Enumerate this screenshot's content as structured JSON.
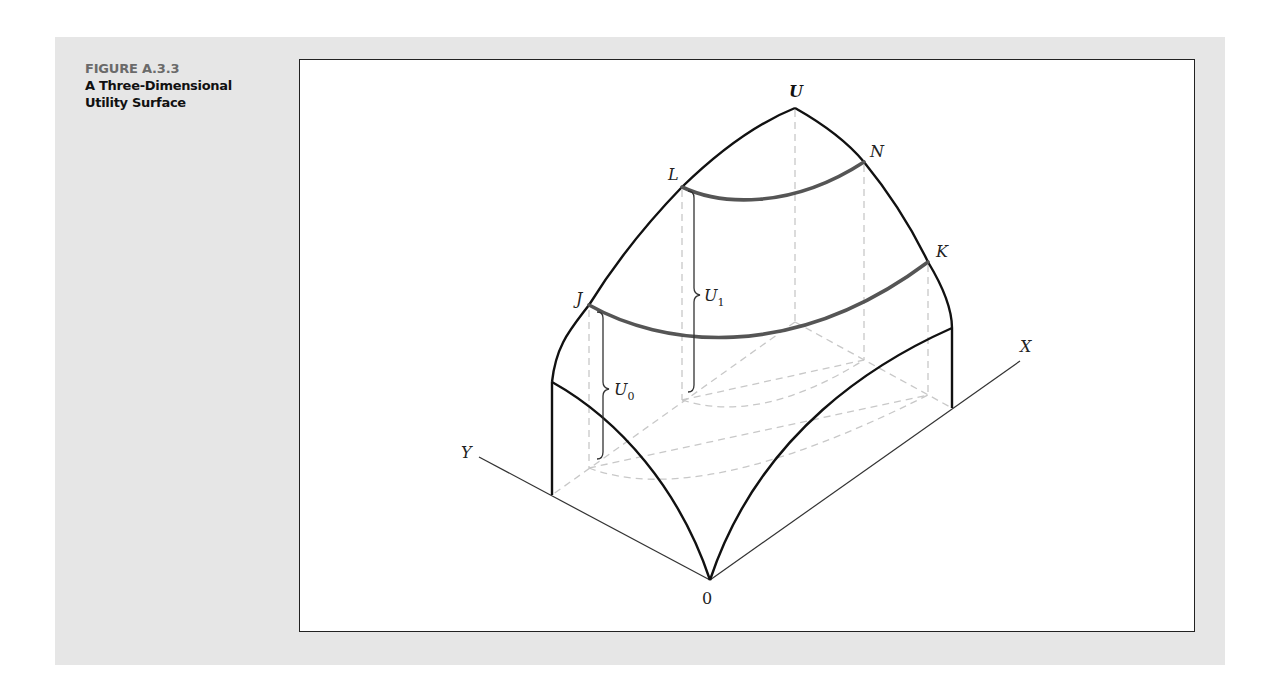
{
  "figure": {
    "number": "FIGURE A.3.3",
    "title_line1": "A Three-Dimensional",
    "title_line2": "Utility Surface"
  },
  "diagram": {
    "labels": {
      "peak": "U",
      "point_L": "L",
      "point_N": "N",
      "point_J": "J",
      "point_K": "K",
      "utility_U1": "U",
      "utility_U1_sub": "1",
      "utility_U0": "U",
      "utility_U0_sub": "0",
      "axis_x": "X",
      "axis_y": "Y",
      "origin": "0"
    },
    "colors": {
      "surface_edge": "#111111",
      "indifference_curve": "#555555",
      "dashed_guides": "#c8c8c8",
      "axes": "#333333",
      "panel_bg": "#e6e6e6"
    }
  }
}
